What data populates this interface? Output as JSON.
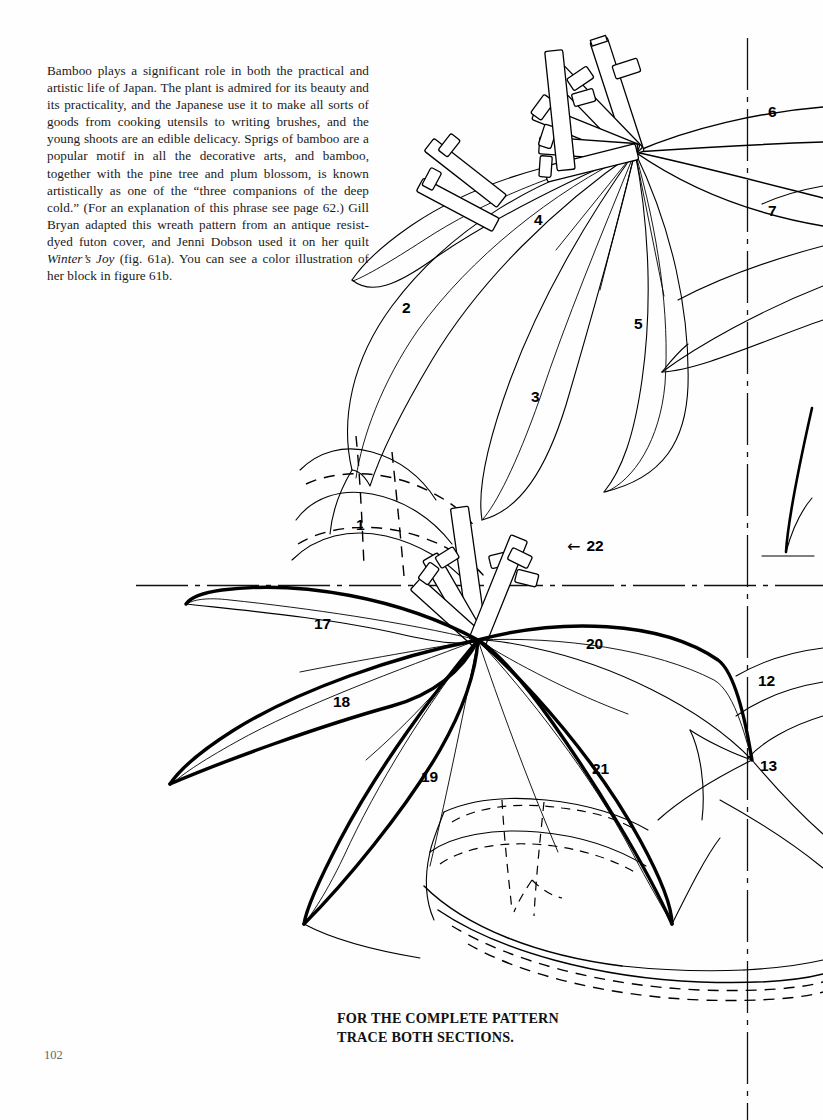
{
  "page": {
    "folio": "102",
    "background_color": "#fefefe",
    "ink_color": "#000000"
  },
  "body_text": {
    "paragraph": "Bamboo plays a significant role in both the practical and artistic life of Japan. The plant is admired for its beauty and its practicality, and the Japanese use it to make all sorts of goods from cooking utensils to writing brushes, and the young shoots are an edible delicacy. Sprigs of bamboo are a popular motif in all the decorative arts, and bamboo, together with the pine tree and plum blossom, is known artistically as one of the “three companions of the deep cold.” (For an explanation of this phrase see page 62.) Gill Bryan adapted this wreath pattern from an antique resist-dyed futon cover, and Jenni Dobson used it on her quilt ",
    "italic_title": "Winter’s Joy",
    "paragraph_tail": " (fig. 61a). You can see a color illustration of her block in figure 61b."
  },
  "caption": {
    "line1": "FOR THE COMPLETE PATTERN",
    "line2": "TRACE BOTH SECTIONS."
  },
  "callouts": [
    {
      "label": "6",
      "x": 768,
      "y": 104,
      "arrow": false
    },
    {
      "label": "7",
      "x": 768,
      "y": 203,
      "arrow": false
    },
    {
      "label": "4",
      "x": 534,
      "y": 212,
      "arrow": false
    },
    {
      "label": "2",
      "x": 402,
      "y": 300,
      "arrow": false
    },
    {
      "label": "5",
      "x": 634,
      "y": 316,
      "arrow": false
    },
    {
      "label": "3",
      "x": 531,
      "y": 389,
      "arrow": false
    },
    {
      "label": "1",
      "x": 356,
      "y": 517,
      "arrow": false
    },
    {
      "label": "22",
      "x": 567,
      "y": 538,
      "arrow": true
    },
    {
      "label": "17",
      "x": 314,
      "y": 616,
      "arrow": false
    },
    {
      "label": "20",
      "x": 586,
      "y": 636,
      "arrow": false
    },
    {
      "label": "12",
      "x": 758,
      "y": 673,
      "arrow": false
    },
    {
      "label": "18",
      "x": 333,
      "y": 694,
      "arrow": false
    },
    {
      "label": "13",
      "x": 760,
      "y": 758,
      "arrow": false
    },
    {
      "label": "19",
      "x": 421,
      "y": 769,
      "arrow": false
    },
    {
      "label": "21",
      "x": 592,
      "y": 761,
      "arrow": false
    }
  ],
  "arrow_glyph": "←",
  "drawing": {
    "subject": "bamboo-wreath-quilt-pattern",
    "centerline_horizontal_y": 585,
    "centerline_vertical_x": 747,
    "description": "Line drawing of two bamboo sprigs forming part of a circular wreath: an upper sprig of long pointed leaves radiating from a node with hatched bamboo culms, and a lower sprig of heavier-outlined leaves, with dash-dot register centerlines and dashed seam lines."
  }
}
